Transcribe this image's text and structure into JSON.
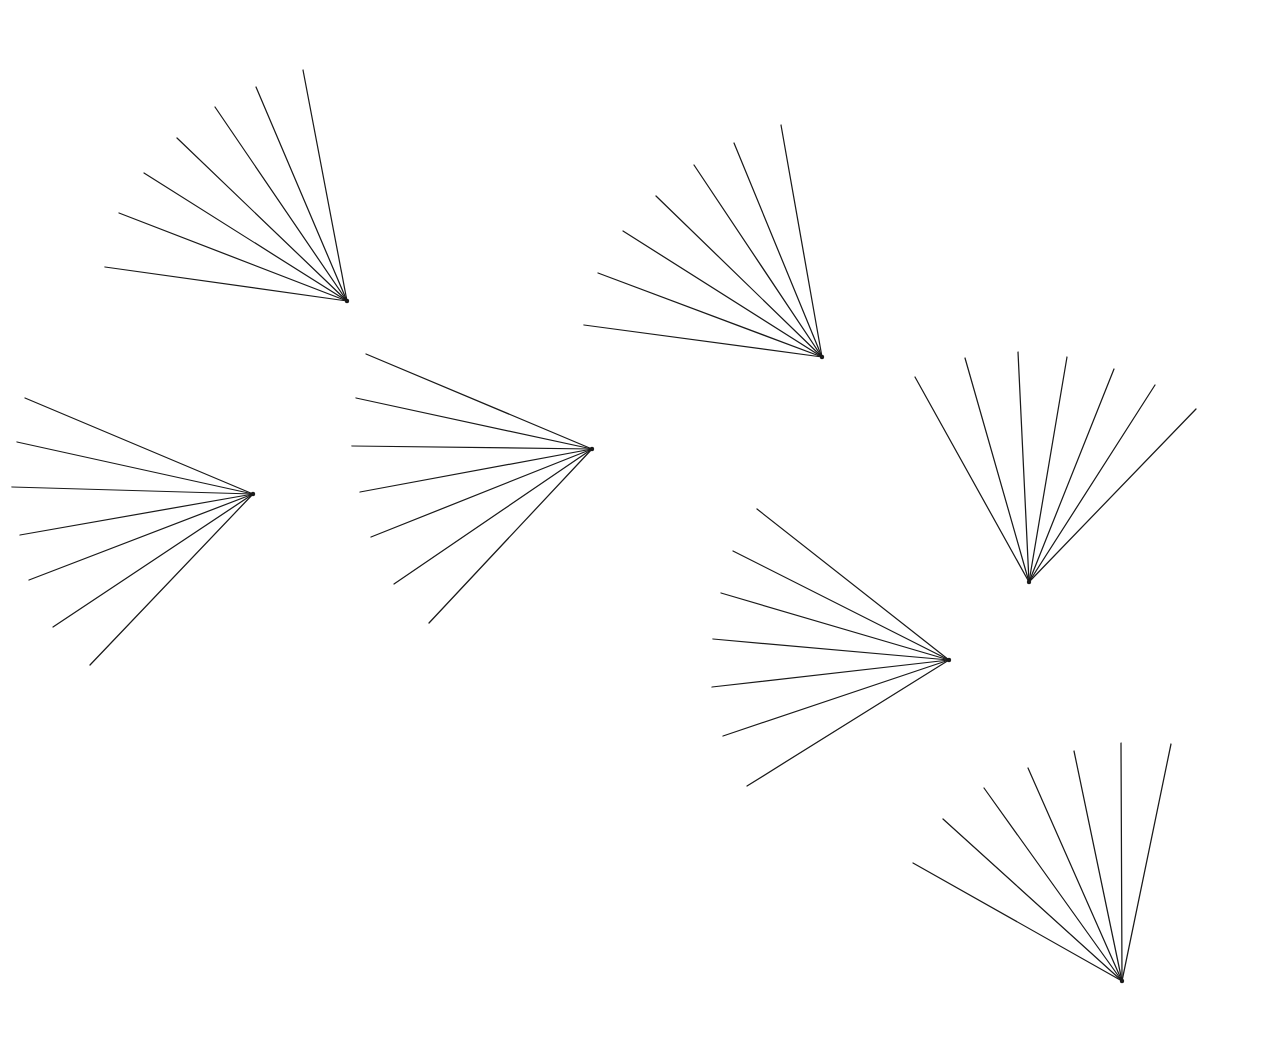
{
  "figure": {
    "canvas": {
      "width": 1274,
      "height": 1054
    },
    "background_color": "#ffffff",
    "stroke_color": "#1a1a1a",
    "stroke_width": 1.25,
    "fan_count": 7,
    "rays_per_fan": 7
  },
  "chart_data": {
    "type": "scatter",
    "xlabel": "",
    "ylabel": "",
    "xlim": [
      0,
      1274
    ],
    "ylim": [
      0,
      1054
    ],
    "grid": false,
    "legend": "none",
    "series": [
      {
        "name": "fan-1",
        "vertex": [
          347,
          301
        ],
        "ray_count": 7,
        "tips": [
          [
            303,
            70
          ],
          [
            256,
            87
          ],
          [
            215,
            107
          ],
          [
            177,
            138
          ],
          [
            144,
            173
          ],
          [
            119,
            213
          ],
          [
            105,
            267
          ]
        ]
      },
      {
        "name": "fan-2",
        "vertex": [
          253,
          494
        ],
        "ray_count": 7,
        "tips": [
          [
            25,
            398
          ],
          [
            17,
            442
          ],
          [
            12,
            487
          ],
          [
            20,
            535
          ],
          [
            29,
            580
          ],
          [
            53,
            627
          ],
          [
            90,
            665
          ]
        ]
      },
      {
        "name": "fan-3",
        "vertex": [
          592,
          449
        ],
        "ray_count": 7,
        "tips": [
          [
            366,
            354
          ],
          [
            356,
            398
          ],
          [
            352,
            446
          ],
          [
            360,
            492
          ],
          [
            371,
            537
          ],
          [
            394,
            584
          ],
          [
            429,
            623
          ]
        ]
      },
      {
        "name": "fan-4",
        "vertex": [
          822,
          357
        ],
        "ray_count": 7,
        "tips": [
          [
            781,
            125
          ],
          [
            734,
            143
          ],
          [
            694,
            165
          ],
          [
            656,
            196
          ],
          [
            623,
            231
          ],
          [
            598,
            273
          ],
          [
            584,
            325
          ]
        ]
      },
      {
        "name": "fan-5",
        "vertex": [
          1029,
          582
        ],
        "ray_count": 7,
        "tips": [
          [
            915,
            377
          ],
          [
            965,
            358
          ],
          [
            1018,
            352
          ],
          [
            1067,
            357
          ],
          [
            1114,
            369
          ],
          [
            1155,
            385
          ],
          [
            1196,
            409
          ]
        ]
      },
      {
        "name": "fan-6",
        "vertex": [
          949,
          660
        ],
        "ray_count": 7,
        "tips": [
          [
            757,
            509
          ],
          [
            733,
            551
          ],
          [
            721,
            593
          ],
          [
            713,
            639
          ],
          [
            712,
            687
          ],
          [
            723,
            736
          ],
          [
            747,
            786
          ]
        ]
      },
      {
        "name": "fan-7",
        "vertex": [
          1122,
          981
        ],
        "ray_count": 7,
        "tips": [
          [
            913,
            863
          ],
          [
            943,
            819
          ],
          [
            984,
            788
          ],
          [
            1028,
            768
          ],
          [
            1074,
            751
          ],
          [
            1121,
            743
          ],
          [
            1171,
            744
          ]
        ]
      }
    ]
  }
}
